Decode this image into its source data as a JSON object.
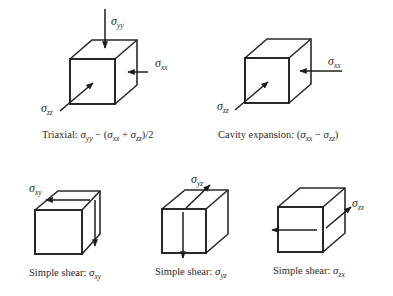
{
  "diagram": {
    "type": "stress-state-cubes",
    "panels": [
      {
        "id": "triaxial",
        "caption_prefix": "Triaxial: ",
        "caption_formula": "σyy − (σxx + σzz)/2",
        "caption_parts": {
          "a": "σ",
          "a_sub": "yy",
          "mid": " − (",
          "b": "σ",
          "b_sub": "xx",
          "plus": " + ",
          "c": "σ",
          "c_sub": "zz",
          "end": ")/2"
        },
        "labels": [
          {
            "sym": "σ",
            "sub": "yy"
          },
          {
            "sym": "σ",
            "sub": "xx"
          },
          {
            "sym": "σ",
            "sub": "zz"
          }
        ]
      },
      {
        "id": "cavity-expansion",
        "caption_prefix": "Cavity expansion: ",
        "caption_formula": "(σxx − σzz)",
        "caption_parts": {
          "open": "(",
          "a": "σ",
          "a_sub": "xx",
          "mid": " − ",
          "b": "σ",
          "b_sub": "zz",
          "close": ")"
        },
        "labels": [
          {
            "sym": "σ",
            "sub": "xx"
          },
          {
            "sym": "σ",
            "sub": "zz"
          }
        ]
      },
      {
        "id": "simple-shear-xy",
        "caption_prefix": "Simple shear: ",
        "caption_parts": {
          "a": "σ",
          "a_sub": "xy"
        },
        "labels": [
          {
            "sym": "σ",
            "sub": "xy"
          }
        ]
      },
      {
        "id": "simple-shear-yz",
        "caption_prefix": "Simple shear: ",
        "caption_parts": {
          "a": "σ",
          "a_sub": "yz"
        },
        "labels": [
          {
            "sym": "σ",
            "sub": "yz"
          }
        ]
      },
      {
        "id": "simple-shear-zx",
        "caption_prefix": "Simple shear: ",
        "caption_parts": {
          "a": "σ",
          "a_sub": "zx"
        },
        "labels": [
          {
            "sym": "σ",
            "sub": "zx"
          }
        ]
      }
    ]
  }
}
